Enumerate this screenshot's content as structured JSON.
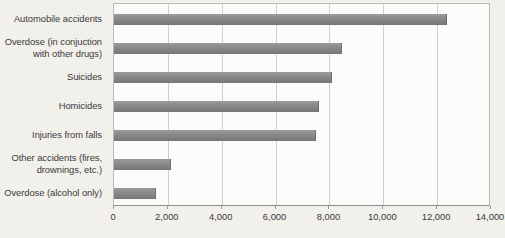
{
  "chart_data": {
    "type": "bar",
    "orientation": "horizontal",
    "title": "",
    "subtitle": "",
    "xlabel": "",
    "ylabel": "",
    "xlim": [
      0,
      14000
    ],
    "xtick_step": 2000,
    "xticks": [
      "0",
      "2,000",
      "4,000",
      "6,000",
      "8,000",
      "10,000",
      "12,000",
      "14,000"
    ],
    "xtick_values": [
      0,
      2000,
      4000,
      6000,
      8000,
      10000,
      12000,
      14000
    ],
    "grid": true,
    "grid_axis": "x",
    "legend": false,
    "legend_position": "none",
    "categories": [
      "Automobile accidents",
      "Overdose (in conjuction with other drugs)",
      "Suicides",
      "Homicides",
      "Injuries from falls",
      "Other accidents (fires, drownings, etc.)",
      "Overdose (alcohol only)"
    ],
    "category_lines": [
      [
        "Automobile accidents"
      ],
      [
        "Overdose (in conjuction",
        "with other drugs)"
      ],
      [
        "Suicides"
      ],
      [
        "Homicides"
      ],
      [
        "Injuries from falls"
      ],
      [
        "Other accidents (fires,",
        "drownings, etc.)"
      ],
      [
        "Overdose (alcohol only)"
      ]
    ],
    "values": [
      12350,
      8450,
      8100,
      7600,
      7500,
      2100,
      1550
    ]
  },
  "colors": {
    "page_background": "#f2f0eb",
    "plot_background": "#fbfbfa",
    "bar_fill": "#8a8a8a",
    "bar_edge": "#6f6f6f",
    "gridline": "#cfcfcf",
    "axis_line": "#8f8f8f",
    "plot_border": "#b9b9b9",
    "text": "#39383a"
  }
}
